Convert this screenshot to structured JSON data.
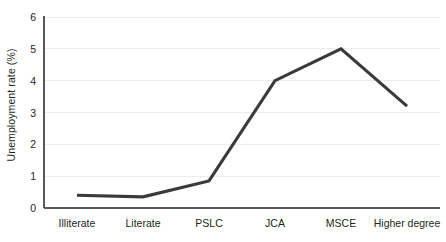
{
  "chart_data": {
    "type": "line",
    "title": "",
    "subtitle": "",
    "xlabel": "",
    "ylabel": "Unemployment rate (%)",
    "categories": [
      "Illiterate",
      "Literate",
      "PSLC",
      "JCA",
      "MSCE",
      "Higher degree"
    ],
    "values": [
      0.4,
      0.35,
      0.85,
      4.0,
      5.0,
      3.2
    ],
    "series": [
      {
        "name": "Unemployment rate",
        "values": [
          0.4,
          0.35,
          0.85,
          4.0,
          5.0,
          3.2
        ]
      }
    ],
    "ylim": [
      0,
      6
    ],
    "yticks": [
      0,
      1,
      2,
      3,
      4,
      5,
      6
    ],
    "ytick_labels": [
      "0",
      "1",
      "2",
      "3",
      "4",
      "5",
      "6"
    ],
    "grid": true,
    "grid_axis": "y",
    "legend": false,
    "legend_position": "none",
    "line_color": "#3a3a3c",
    "grid_color": "#ececed",
    "axis_color": "#58595b",
    "background_color": "#ffffff"
  }
}
